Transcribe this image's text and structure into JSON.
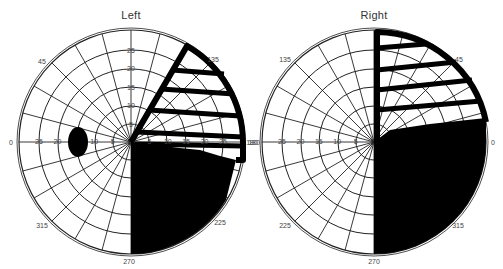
{
  "fields": [
    {
      "title": "Left",
      "center": [
        131,
        142
      ],
      "radius": 112,
      "angle_labels": [
        {
          "text": "45",
          "x": 42,
          "y": 64
        },
        {
          "text": "135",
          "x": 213,
          "y": 62
        },
        {
          "text": "0",
          "x": 11,
          "y": 145
        },
        {
          "text": "180",
          "x": 254,
          "y": 145
        },
        {
          "text": "315",
          "x": 42,
          "y": 228
        },
        {
          "text": "225",
          "x": 220,
          "y": 225
        },
        {
          "text": "270",
          "x": 129,
          "y": 264
        }
      ],
      "meridian_ticks_vertical": [
        "25",
        "20",
        "15",
        "10",
        "5"
      ],
      "meridian_ticks_left": [
        "25",
        "20",
        "10",
        "5"
      ],
      "meridian_ticks_right": [
        "5",
        "10",
        "15",
        "20",
        "25"
      ],
      "blind_spot": {
        "cx": 78,
        "cy": 142,
        "rx": 10,
        "ry": 15
      }
    },
    {
      "title": "Right",
      "center": [
        374,
        142
      ],
      "radius": 112,
      "angle_labels": [
        {
          "text": "135",
          "x": 285,
          "y": 62
        },
        {
          "text": "45",
          "x": 459,
          "y": 62
        },
        {
          "text": "180",
          "x": 252,
          "y": 145
        },
        {
          "text": "0",
          "x": 493,
          "y": 145
        },
        {
          "text": "225",
          "x": 285,
          "y": 228
        },
        {
          "text": "315",
          "x": 458,
          "y": 228
        },
        {
          "text": "270",
          "x": 374,
          "y": 264
        }
      ],
      "meridian_ticks_left": [
        "25",
        "20",
        "15",
        "10",
        "5"
      ]
    }
  ],
  "colors": {
    "grid": "#222222",
    "fill": "#000000",
    "label": "#444444"
  }
}
